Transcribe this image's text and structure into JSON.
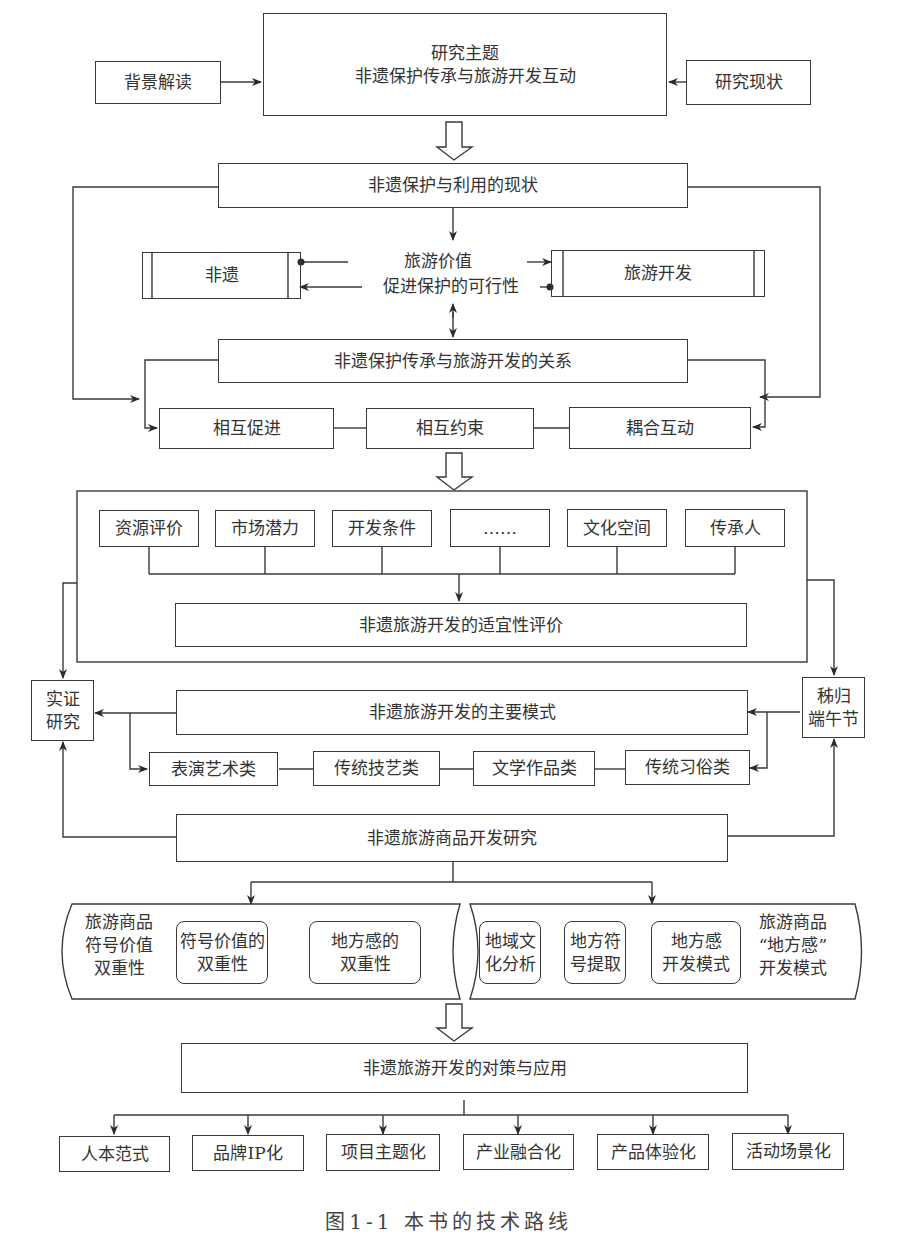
{
  "diagram": {
    "top": {
      "left_input": "背景解读",
      "title_line1": "研究主题",
      "title_line2": "非遗保护传承与旅游开发互动",
      "right_input": "研究现状"
    },
    "status": {
      "title": "非遗保护与利用的现状",
      "left_node": "非遗",
      "right_node": "旅游开发",
      "forward_label": "旅游价值",
      "backward_label": "促进保护的可行性"
    },
    "relation": {
      "title": "非遗保护传承与旅游开发的关系",
      "items": [
        "相互促进",
        "相互约束",
        "耦合互动"
      ]
    },
    "evaluation": {
      "factors": [
        "资源评价",
        "市场潜力",
        "开发条件",
        "……",
        "文化空间",
        "传承人"
      ],
      "title": "非遗旅游开发的适宜性评价"
    },
    "side": {
      "left_box_line1": "实证",
      "left_box_line2": "研究",
      "right_box_line1": "秭归",
      "right_box_line2": "端午节"
    },
    "modes": {
      "title": "非遗旅游开发的主要模式",
      "items": [
        "表演艺术类",
        "传统技艺类",
        "文学作品类",
        "传统习俗类"
      ]
    },
    "products": {
      "title": "非遗旅游商品开发研究",
      "left_panel": {
        "label_lines": [
          "旅游商品",
          "符号价值",
          "双重性"
        ],
        "items": [
          {
            "line1": "符号价值的",
            "line2": "双重性"
          },
          {
            "line1": "地方感的",
            "line2": "双重性"
          }
        ]
      },
      "right_panel": {
        "items": [
          {
            "line1": "地域文",
            "line2": "化分析"
          },
          {
            "line1": "地方符",
            "line2": "号提取"
          },
          {
            "line1": "地方感",
            "line2": "开发模式"
          }
        ],
        "label_lines": [
          "旅游商品",
          "“地方感”",
          "开发模式"
        ]
      }
    },
    "strategy": {
      "title": "非遗旅游开发的对策与应用",
      "items": [
        "人本范式",
        "品牌IP化",
        "项目主题化",
        "产业融合化",
        "产品体验化",
        "活动场景化"
      ]
    },
    "caption": "图1-1 本书的技术路线"
  },
  "colors": {
    "line": "#3a3a3a",
    "text": "#333333",
    "background": "#ffffff"
  }
}
